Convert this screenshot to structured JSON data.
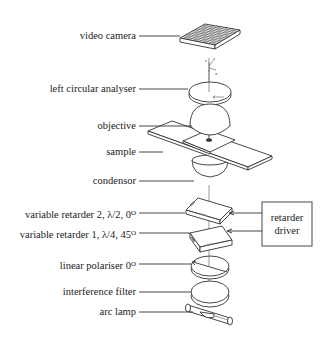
{
  "diagram": {
    "type": "exploded optical setup",
    "components": [
      {
        "id": "video-camera",
        "label": "video camera"
      },
      {
        "id": "left-circular-analyser",
        "label": "left circular analyser"
      },
      {
        "id": "objective",
        "label": "objective"
      },
      {
        "id": "sample",
        "label": "sample"
      },
      {
        "id": "condensor",
        "label": "condensor"
      },
      {
        "id": "variable-retarder-2",
        "label": "variable retarder 2, λ/2,  0",
        "sup": "O"
      },
      {
        "id": "variable-retarder-1",
        "label": "variable retarder 1, λ/4,  45",
        "sup": "O"
      },
      {
        "id": "linear-polariser",
        "label": "linear polariser 0",
        "sup": "O"
      },
      {
        "id": "interference-filter",
        "label": "interference filter"
      },
      {
        "id": "arc-lamp",
        "label": "arc lamp"
      }
    ],
    "retarder_driver": {
      "line1": "retarder",
      "line2": "driver"
    },
    "axes": {
      "z": "z",
      "y": "y",
      "x": "x"
    }
  }
}
